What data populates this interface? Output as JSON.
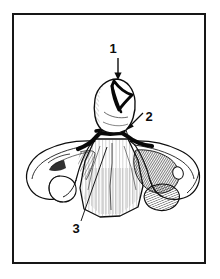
{
  "figure": {
    "kind": "anatomical-line-drawing",
    "view": "anterior view",
    "border_color": "#161616",
    "ink_color": "#0d0d0d",
    "background_color": "#ffffff"
  },
  "callouts": [
    {
      "id": "callout-1",
      "label": "1",
      "label_x": 113,
      "label_y": 52,
      "pointer": "vertical-arrow-down",
      "target": "odontoid process apex fracture line",
      "arrow": {
        "x1": 118,
        "y1": 57,
        "x2": 118,
        "y2": 79
      }
    },
    {
      "id": "callout-2",
      "label": "2",
      "label_x": 146,
      "label_y": 120,
      "pointer": "diagonal-arrow-down-left",
      "target": "base of dens / body junction fracture",
      "arrow": {
        "x1": 143,
        "y1": 117,
        "x2": 124,
        "y2": 131
      }
    },
    {
      "id": "callout-3",
      "label": "3",
      "label_x": 72,
      "label_y": 232,
      "pointer": "diagonal-leader-line-up-right",
      "target": "anterior surface of vertebral body",
      "arrow": {
        "x1": 80,
        "y1": 222,
        "x2": 107,
        "y2": 148
      }
    }
  ],
  "anatomy": {
    "dens": "odontoid process",
    "body": "vertebral body",
    "left_transverse_process": "left transverse process",
    "right_transverse_process": "right transverse process",
    "fracture_lines": [
      "apex oblique fracture",
      "basilar transverse fracture"
    ]
  }
}
